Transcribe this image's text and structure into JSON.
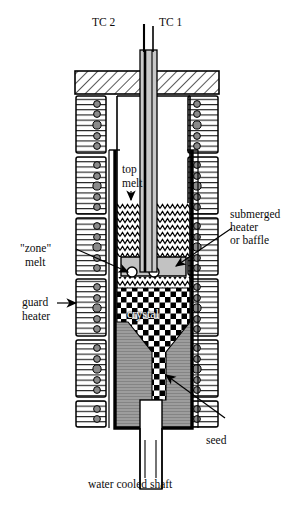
{
  "figure": {
    "kind": "cross-section schematic"
  },
  "labels": {
    "tc2": "TC 2",
    "tc1": "TC 1",
    "top_melt_line1": "top",
    "top_melt_line2": "melt",
    "submerged_line1": "submerged",
    "submerged_line2": "heater",
    "submerged_line3": "or baffle",
    "zone_melt_line1": "\"zone\"",
    "zone_melt_line2": "melt",
    "guard_line1": "guard",
    "guard_line2": "heater",
    "crystal": "crystal",
    "seed": "seed",
    "shaft": "water cooled shaft"
  },
  "colors": {
    "ink": "#101010",
    "crucible_wall": "#000000",
    "melt_gray": "#b9b9b9",
    "solid_gray": "#9a9a9a",
    "heater_block": "#ffffff",
    "heater_dot": "#8a8a8a",
    "baffle_fill": "#c2c2c2",
    "shaft_fill": "#c8c8c8",
    "background": "#ffffff"
  },
  "geometry": {
    "canvas_width": 306,
    "canvas_height": 509,
    "lid_left": 75,
    "lid_right": 219,
    "lid_top": 71,
    "lid_bottom": 94,
    "crucible_left": 115,
    "crucible_right": 192,
    "melt_surface_y": 203,
    "baffle_top_y": 257,
    "baffle_bottom_y": 277,
    "crystal_top_y": 288,
    "crystal_taper_y": 337,
    "base_bottom_y": 428,
    "shaft_bottom_y": 489
  }
}
